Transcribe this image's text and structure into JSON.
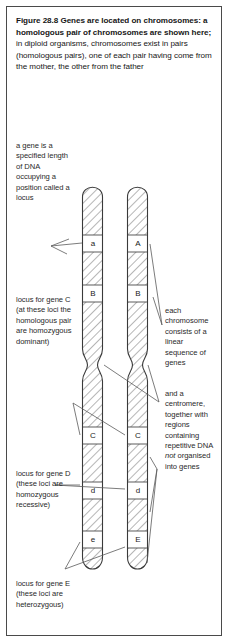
{
  "figure": {
    "caption_bold": "Figure 28.8  Genes are located on chromosomes: a homologous pair of chromosomes are shown here;",
    "caption_rest": " in diploid organisms, chromosomes exist in pairs (homologous pairs), one of each pair having come from the mother, the other from the father"
  },
  "annotations": {
    "gene_definition": "a gene is a specified length of DNA occupying a position called a locus",
    "locus_c": "locus for gene C (at these loci the homologous pair are homozygous dominant)",
    "locus_d": "locus for gene D (these loci are homozygous recessive)",
    "locus_e": "locus for gene E (these loci are heterozygous)",
    "linear_sequence": "each chromosome consists of a linear sequence of genes",
    "centromere_pre": "and a centromere, together with regions containing repetitive DNA ",
    "centromere_italic": "not",
    "centromere_post": " organised into genes"
  },
  "diagram": {
    "left_chromosome": {
      "name": "maternal-chromosome",
      "bands": [
        "a",
        "B",
        "C",
        "d",
        "e"
      ]
    },
    "right_chromosome": {
      "name": "paternal-chromosome",
      "bands": [
        "A",
        "B",
        "C",
        "d",
        "E"
      ]
    }
  },
  "colors": {
    "frame": "#4a4a4a",
    "text": "#1b1b1b",
    "hatch": "#6e6e6e",
    "outline": "#3a3a3a",
    "leader": "#5a5a5a"
  }
}
